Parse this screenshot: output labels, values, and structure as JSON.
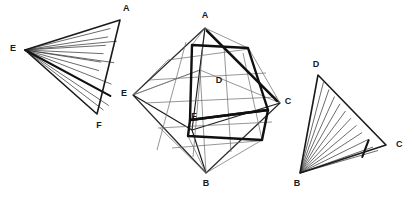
{
  "figure": {
    "background_color": "#ffffff",
    "stroke_color": "#1a1a1a",
    "width": 415,
    "height": 200,
    "panels": [
      {
        "id": "left-triangle",
        "name": "hatched-triangle-AEF",
        "kind": "hatched-triangle",
        "vertices": [
          {
            "label": "A",
            "x": 120,
            "y": 20,
            "label_x": 123,
            "label_y": 9
          },
          {
            "label": "E",
            "x": 25,
            "y": 50,
            "label_x": 13,
            "label_y": 49
          },
          {
            "label": "F",
            "x": 97,
            "y": 114,
            "label_x": 99,
            "label_y": 126
          }
        ],
        "hatch_count": 11,
        "hatch_from": "E",
        "hatch_to_edge": [
          "A",
          "F"
        ],
        "bold_hatch_index": 8
      },
      {
        "id": "center-octahedron",
        "name": "octahedron-ABCE",
        "kind": "octahedron",
        "vertices": [
          {
            "label": "A",
            "x": 205,
            "y": 28,
            "label_x": 205,
            "label_y": 16
          },
          {
            "label": "E",
            "x": 133,
            "y": 95,
            "label_x": 124,
            "label_y": 94
          },
          {
            "label": "C",
            "x": 280,
            "y": 103,
            "label_x": 288,
            "label_y": 102
          },
          {
            "label": "B",
            "x": 206,
            "y": 173,
            "label_x": 206,
            "label_y": 184
          },
          {
            "label": "D",
            "x": 219,
            "y": 81,
            "label_x": 219,
            "label_y": 81,
            "interior": true
          },
          {
            "label": "F",
            "x": 194,
            "y": 117,
            "label_x": 194,
            "label_y": 117,
            "interior": true
          }
        ],
        "inner_quad_top": [
          [
            192,
            45
          ],
          [
            248,
            48
          ],
          [
            268,
            110
          ],
          [
            190,
            120
          ]
        ],
        "inner_quad_bottom": [
          [
            190,
            120
          ],
          [
            268,
            110
          ],
          [
            262,
            140
          ],
          [
            188,
            136
          ]
        ]
      },
      {
        "id": "right-triangle",
        "name": "hatched-triangle-DBC",
        "kind": "hatched-triangle",
        "vertices": [
          {
            "label": "D",
            "x": 318,
            "y": 75,
            "label_x": 316,
            "label_y": 65
          },
          {
            "label": "B",
            "x": 300,
            "y": 173,
            "label_x": 297,
            "label_y": 184
          },
          {
            "label": "C",
            "x": 386,
            "y": 145,
            "label_x": 396,
            "label_y": 145
          }
        ],
        "hatch_count": 11,
        "hatch_from": "B",
        "hatch_to_edge": [
          "D",
          "C"
        ],
        "bold_hatch_index": 9
      }
    ],
    "labels": [
      "A",
      "B",
      "C",
      "D",
      "E",
      "F"
    ]
  }
}
